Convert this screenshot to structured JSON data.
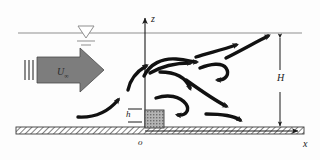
{
  "figure": {
    "type": "fluid-flow-schematic",
    "background_color": "#fdfdfd",
    "ink_color": "#1a1a1a",
    "arrow_fill": "#7d7d7d",
    "block_fill": "#a8a8a8"
  },
  "labels": {
    "z_axis": "z",
    "x_axis": "x",
    "origin": "o",
    "depth": "H",
    "obstacle_height": "h",
    "velocity_symbol": "U",
    "velocity_subscript": "∞"
  },
  "elements": {
    "water_surface_name": "free-surface-line",
    "water_symbol_name": "water-level-triangle",
    "ground_name": "channel-bed-hatched",
    "obstacle_name": "bottom-obstacle-block",
    "inflow_arrow_name": "inflow-block-arrow",
    "wake_name": "turbulent-wake-streamlines"
  },
  "geometry": {
    "water_surface_y": 33,
    "bed_y": 131,
    "origin_x": 145,
    "obstacle_left": 145,
    "obstacle_right": 163,
    "obstacle_top": 110,
    "H_line_x": 280,
    "z_axis_top": 16,
    "x_axis_right": 300
  },
  "streamline_count": 11
}
